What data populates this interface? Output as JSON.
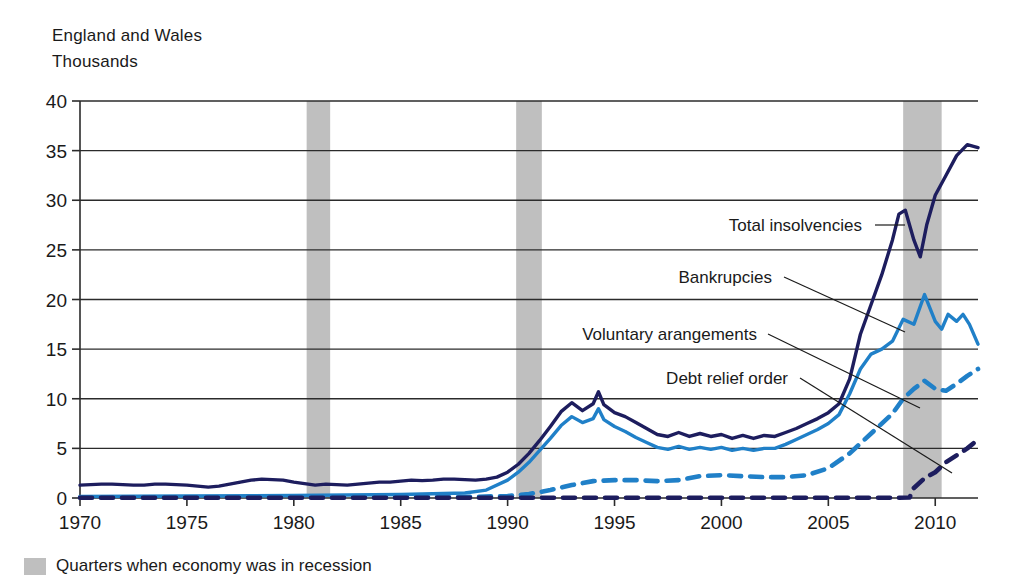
{
  "header": {
    "region": "England and Wales",
    "units": "Thousands"
  },
  "legend": {
    "recession_label": "Quarters when economy was in recession",
    "recession_color": "#bfbfbf"
  },
  "annotations": [
    {
      "id": "total-insolvencies",
      "label": "Total insolvencies"
    },
    {
      "id": "bankrupcies",
      "label": "Bankrupcies"
    },
    {
      "id": "voluntary-arangements",
      "label": "Voluntary arangements"
    },
    {
      "id": "debt-relief-order",
      "label": "Debt relief order"
    }
  ],
  "chart_data": {
    "type": "line",
    "title": "",
    "subtitle": "",
    "xlabel": "",
    "ylabel": "Thousands",
    "region": "England and Wales",
    "xlim": [
      1970,
      2012
    ],
    "ylim": [
      0,
      40
    ],
    "ytick_values": [
      0,
      5,
      10,
      15,
      20,
      25,
      30,
      35,
      40
    ],
    "ytick_labels": [
      "0",
      "5",
      "10",
      "15",
      "20",
      "25",
      "30",
      "35",
      "40"
    ],
    "xtick_values": [
      1970,
      1975,
      1980,
      1985,
      1990,
      1995,
      2000,
      2005,
      2010
    ],
    "xtick_labels": [
      "1970",
      "1975",
      "1980",
      "1985",
      "1990",
      "1995",
      "2000",
      "2005",
      "2010"
    ],
    "grid": true,
    "grid_axis": "y",
    "legend_position": "annotations",
    "colors": {
      "total_insolvencies": "#1d1d5e",
      "bankrupcies": "#2080c8",
      "voluntary_arangements": "#2080c8",
      "debt_relief_order": "#1d1d5e"
    },
    "recession_bands": [
      {
        "start": 1980.6,
        "end": 1981.7
      },
      {
        "start": 1990.4,
        "end": 1991.6
      },
      {
        "start": 2008.5,
        "end": 2010.3
      }
    ],
    "series": [
      {
        "name": "Total insolvencies",
        "style": "solid",
        "color": "#1d1d5e",
        "x": [
          1970,
          1970.5,
          1971,
          1971.5,
          1972,
          1972.5,
          1973,
          1973.5,
          1974,
          1974.5,
          1975,
          1975.5,
          1976,
          1976.5,
          1977,
          1977.5,
          1978,
          1978.5,
          1979,
          1979.5,
          1980,
          1980.5,
          1981,
          1981.5,
          1982,
          1982.5,
          1983,
          1983.5,
          1984,
          1984.5,
          1985,
          1985.5,
          1986,
          1986.5,
          1987,
          1987.5,
          1988,
          1988.5,
          1989,
          1989.5,
          1990,
          1990.5,
          1991,
          1991.5,
          1992,
          1992.5,
          1993,
          1993.5,
          1994,
          1994.25,
          1994.5,
          1995,
          1995.5,
          1996,
          1996.5,
          1997,
          1997.5,
          1998,
          1998.5,
          1999,
          1999.5,
          2000,
          2000.5,
          2001,
          2001.5,
          2002,
          2002.5,
          2003,
          2003.5,
          2004,
          2004.5,
          2005,
          2005.5,
          2006,
          2006.5,
          2007,
          2007.5,
          2008,
          2008.3,
          2008.6,
          2009,
          2009.3,
          2009.6,
          2010,
          2010.5,
          2011,
          2011.5,
          2012
        ],
        "y": [
          1.3,
          1.35,
          1.4,
          1.4,
          1.35,
          1.3,
          1.3,
          1.4,
          1.4,
          1.35,
          1.3,
          1.2,
          1.1,
          1.2,
          1.4,
          1.6,
          1.8,
          1.9,
          1.85,
          1.8,
          1.6,
          1.45,
          1.3,
          1.4,
          1.35,
          1.3,
          1.4,
          1.5,
          1.6,
          1.6,
          1.7,
          1.8,
          1.75,
          1.8,
          1.9,
          1.9,
          1.85,
          1.8,
          1.9,
          2.1,
          2.6,
          3.4,
          4.5,
          5.8,
          7.2,
          8.7,
          9.6,
          8.8,
          9.5,
          10.7,
          9.4,
          8.6,
          8.2,
          7.6,
          7.0,
          6.4,
          6.2,
          6.6,
          6.2,
          6.5,
          6.2,
          6.4,
          6.0,
          6.3,
          6.0,
          6.3,
          6.2,
          6.6,
          7.0,
          7.5,
          8.0,
          8.6,
          9.5,
          12.0,
          16.5,
          19.5,
          22.5,
          26.0,
          28.6,
          29.0,
          26.0,
          24.3,
          27.5,
          30.5,
          32.5,
          34.5,
          35.6,
          35.3
        ]
      },
      {
        "name": "Bankrupcies",
        "style": "solid",
        "color": "#2080c8",
        "x": [
          1970,
          1975,
          1980,
          1985,
          1988,
          1989,
          1990,
          1990.5,
          1991,
          1991.5,
          1992,
          1992.5,
          1993,
          1993.5,
          1994,
          1994.25,
          1994.5,
          1995,
          1995.5,
          1996,
          1996.5,
          1997,
          1997.5,
          1998,
          1998.5,
          1999,
          1999.5,
          2000,
          2000.5,
          2001,
          2001.5,
          2002,
          2002.5,
          2003,
          2003.5,
          2004,
          2004.5,
          2005,
          2005.5,
          2006,
          2006.5,
          2007,
          2007.5,
          2008,
          2008.5,
          2009,
          2009.5,
          2010,
          2010.3,
          2010.6,
          2011,
          2011.3,
          2011.6,
          2012
        ],
        "y": [
          0.15,
          0.2,
          0.25,
          0.35,
          0.5,
          0.8,
          1.8,
          2.6,
          3.6,
          4.8,
          6.0,
          7.3,
          8.2,
          7.6,
          8.0,
          9.0,
          7.9,
          7.2,
          6.7,
          6.1,
          5.6,
          5.1,
          4.9,
          5.2,
          4.9,
          5.1,
          4.9,
          5.1,
          4.8,
          5.0,
          4.8,
          5.0,
          5.0,
          5.4,
          5.9,
          6.4,
          6.9,
          7.5,
          8.4,
          10.5,
          13.0,
          14.5,
          15.0,
          15.8,
          18.0,
          17.5,
          20.5,
          17.8,
          17.0,
          18.5,
          17.8,
          18.5,
          17.5,
          15.5
        ]
      },
      {
        "name": "Voluntary arangements",
        "style": "dashed",
        "color": "#2080c8",
        "x": [
          1970,
          1985,
          1988,
          1990,
          1991,
          1992,
          1993,
          1994,
          1995,
          1996,
          1997,
          1998,
          1999,
          2000,
          2001,
          2002,
          2003,
          2004,
          2005,
          2006,
          2007,
          2008,
          2008.5,
          2009,
          2009.5,
          2010,
          2010.5,
          2011,
          2011.5,
          2012
        ],
        "y": [
          0.05,
          0.08,
          0.1,
          0.2,
          0.4,
          0.8,
          1.3,
          1.7,
          1.8,
          1.8,
          1.7,
          1.8,
          2.2,
          2.3,
          2.2,
          2.1,
          2.1,
          2.3,
          3.0,
          4.5,
          6.5,
          8.5,
          10.0,
          11.0,
          11.8,
          11.0,
          10.8,
          11.5,
          12.3,
          13.0
        ]
      },
      {
        "name": "Debt relief order",
        "style": "dashed",
        "color": "#1d1d5e",
        "x": [
          1970,
          1990,
          2000,
          2005,
          2008,
          2008.8,
          2009,
          2009.5,
          2010,
          2010.5,
          2011,
          2011.5,
          2012
        ],
        "y": [
          0.02,
          0.02,
          0.02,
          0.02,
          0.02,
          0.05,
          1.0,
          2.0,
          2.6,
          3.6,
          4.3,
          5.0,
          5.9
        ]
      }
    ]
  }
}
